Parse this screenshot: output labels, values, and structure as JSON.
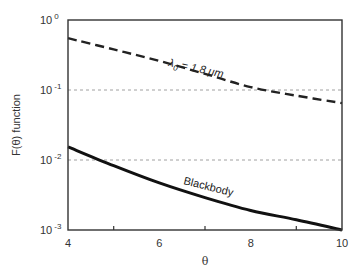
{
  "chart_data": {
    "type": "line",
    "title": "",
    "xlabel": "θ",
    "ylabel": "F(θ) function",
    "xlim": [
      4,
      10
    ],
    "ylim": [
      0.001,
      1
    ],
    "yscale": "log",
    "x_ticks": [
      "4",
      "6",
      "8",
      "10"
    ],
    "x_minor_ticks": [
      5,
      7,
      9
    ],
    "y_ticks": [
      {
        "base": "10",
        "exp": "0"
      },
      {
        "base": "10",
        "exp": "-1"
      },
      {
        "base": "10",
        "exp": "-2"
      },
      {
        "base": "10",
        "exp": "-3"
      }
    ],
    "grid": {
      "horizontal_dotted_at": [
        0.1,
        0.01
      ]
    },
    "legend": "none (inline annotations)",
    "series": [
      {
        "name": "λ0 = 1.8 μm",
        "style": "dashed",
        "x": [
          4,
          5,
          6,
          7,
          8,
          9,
          10
        ],
        "values": [
          0.55,
          0.38,
          0.26,
          0.17,
          0.11,
          0.083,
          0.065
        ]
      },
      {
        "name": "Blackbody",
        "style": "solid",
        "x": [
          4,
          5,
          6,
          7,
          8,
          9,
          10
        ],
        "values": [
          0.0154,
          0.0083,
          0.0047,
          0.0029,
          0.0019,
          0.0014,
          0.001
        ]
      }
    ],
    "annotations": [
      {
        "text_main": "λ",
        "text_sub": "0",
        "text_rest": " = 1.8 μm",
        "near_series": "dashed"
      },
      {
        "text": "Blackbody",
        "near_series": "solid"
      }
    ]
  }
}
